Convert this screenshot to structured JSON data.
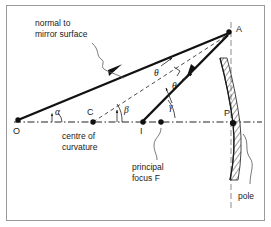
{
  "figure": {
    "kind": "ray-diagram",
    "background_color": "#ffffff",
    "border_color": "#9a9a9a",
    "ink_color": "#111111"
  },
  "points": {
    "object": {
      "label": "O",
      "x": 18,
      "y": 120
    },
    "centre": {
      "label": "C",
      "x": 93,
      "y": 122
    },
    "image": {
      "label": "I",
      "x": 143,
      "y": 122
    },
    "focus": {
      "label": "",
      "x": 161,
      "y": 122
    },
    "pole": {
      "label": "P",
      "x": 233,
      "y": 123
    },
    "incidence": {
      "label": "A",
      "x": 229,
      "y": 32
    }
  },
  "labels": {
    "normal": {
      "line1": "normal to",
      "line2": "mirror surface",
      "x": 35,
      "y": 33
    },
    "centre_of_curvature": {
      "line1": "centre of",
      "line2": "curvature",
      "x": 62,
      "y": 136
    },
    "principal_focus": {
      "line1": "principal",
      "line2": "focus F",
      "x": 134,
      "y": 172
    },
    "pole": {
      "text": "pole",
      "x": 238,
      "y": 196
    }
  },
  "angles": {
    "alpha": {
      "symbol": "α",
      "x": 53,
      "y": 114
    },
    "beta": {
      "symbol": "β",
      "x": 124,
      "y": 112
    },
    "gamma": {
      "symbol": "γ",
      "x": 169,
      "y": 108
    },
    "theta_incident": {
      "symbol": "θ",
      "x": 158,
      "y": 71
    },
    "theta_reflected": {
      "symbol": "θ",
      "x": 176,
      "y": 84
    }
  },
  "axis": {
    "name": "principal-axis",
    "style": "dash-dot",
    "y": 122,
    "x_start": 14,
    "x_end": 262
  },
  "normal_line": {
    "name": "normal-CA",
    "style": "dashed",
    "from": "C",
    "to": "A"
  },
  "mirror": {
    "name": "concave-mirror",
    "hatched": true,
    "pole_x": 233,
    "top_y": 58,
    "bottom_y": 180
  },
  "rays": [
    {
      "name": "incident-ray-OA",
      "from": "O",
      "to": "A",
      "arrow": "toward-A"
    },
    {
      "name": "reflected-ray-AI",
      "from": "A",
      "to": "I",
      "arrow": "toward-I"
    }
  ]
}
